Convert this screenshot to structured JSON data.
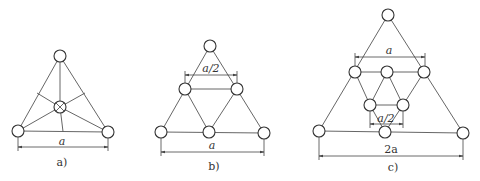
{
  "figures": [
    {
      "id": "a",
      "caption": "a)",
      "dimension_label": "a",
      "nodes": [
        [
          60,
          56
        ],
        [
          18,
          131
        ],
        [
          108,
          132
        ],
        [
          60,
          107
        ]
      ],
      "center_node": 3
    },
    {
      "id": "b",
      "caption": "b)",
      "dimension_label": "a",
      "inner_dimension_label": "a/2",
      "nodes": [
        [
          210,
          46
        ],
        [
          185,
          89
        ],
        [
          237,
          89
        ],
        [
          161,
          132
        ],
        [
          209,
          132
        ],
        [
          264,
          133
        ]
      ]
    },
    {
      "id": "c",
      "caption": "c)",
      "dimension_label": "2a",
      "upper_dimension_label": "a",
      "inner_dimension_label": "a/2",
      "nodes": [
        [
          388,
          15
        ],
        [
          355,
          72
        ],
        [
          387,
          72
        ],
        [
          424,
          72
        ],
        [
          370,
          105
        ],
        [
          403,
          105
        ],
        [
          319,
          131
        ],
        [
          385,
          132
        ],
        [
          463,
          133
        ]
      ]
    }
  ],
  "colors": {
    "line": "#555555",
    "node": "#333333",
    "background": "#ffffff"
  }
}
